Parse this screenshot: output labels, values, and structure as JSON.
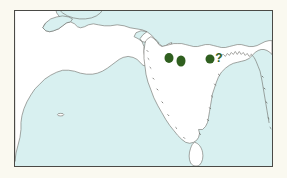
{
  "figure": {
    "type": "distribution-map",
    "region": "South Asia and the Arabian Sea",
    "background_color": "#faf9f0",
    "frame": {
      "border_color": "#4a4a46",
      "x": 14,
      "y": 10,
      "width": 259,
      "height": 157
    }
  },
  "map": {
    "ocean_color": "#d8f0f0",
    "land_color": "#ffffff",
    "coastline_color": "#6b6b66",
    "coastline_width": 0.6,
    "landmasses": [
      {
        "name": "arabian-peninsula-and-iran"
      },
      {
        "name": "indian-subcontinent"
      },
      {
        "name": "sri-lanka"
      },
      {
        "name": "bahrain-islet"
      }
    ]
  },
  "markers": {
    "color": "#2f5f1f",
    "shape": "filled-ellipse",
    "count": 3,
    "items": [
      {
        "name": "record-site-1",
        "x": 168,
        "y": 56,
        "rx": 4.2,
        "ry": 4.6
      },
      {
        "name": "record-site-2",
        "x": 180,
        "y": 59,
        "rx": 4.0,
        "ry": 4.8
      },
      {
        "name": "record-site-3",
        "x": 209,
        "y": 57,
        "rx": 4.2,
        "ry": 4.2
      }
    ]
  },
  "annotations": [
    {
      "name": "uncertain-record-query",
      "text": "?",
      "x": 217,
      "y": 56,
      "color": "#2f5f1f",
      "font_size": 11
    }
  ]
}
